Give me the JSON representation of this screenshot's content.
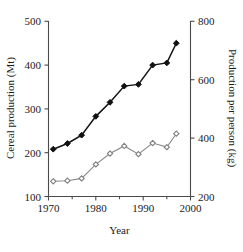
{
  "chart_data": {
    "type": "line",
    "title": "",
    "xlabel": "Year",
    "ylabel": "Cereal production (Mt)",
    "y2label": "Production per person (kg)",
    "xlim": [
      1970,
      2000
    ],
    "ylim": [
      100,
      500
    ],
    "y2lim": [
      200,
      800
    ],
    "xticks": [
      1970,
      1980,
      1990,
      2000
    ],
    "xtick_labels": [
      "1970",
      "1980",
      "1990",
      "2000"
    ],
    "xticks_minor": [
      1975,
      1985,
      1995
    ],
    "yticks": [
      100,
      200,
      300,
      400,
      500
    ],
    "ytick_labels": [
      "100",
      "200",
      "300",
      "400",
      "500"
    ],
    "y2ticks": [
      200,
      400,
      600,
      800
    ],
    "y2tick_labels": [
      "200",
      "400",
      "600",
      "800"
    ],
    "grid": false,
    "legend": "none",
    "series": [
      {
        "name": "Cereal production",
        "axis": "left",
        "marker": "filled-diamond",
        "color": "#111111",
        "x": [
          1971,
          1974,
          1977,
          1980,
          1983,
          1986,
          1989,
          1992,
          1995,
          1997
        ],
        "values": [
          208,
          221,
          240,
          283,
          315,
          352,
          356,
          400,
          405,
          450
        ]
      },
      {
        "name": "Production per person",
        "axis": "right",
        "marker": "open-diamond",
        "color": "#7d7d7d",
        "x": [
          1971,
          1974,
          1977,
          1980,
          1983,
          1986,
          1989,
          1992,
          1995,
          1997
        ],
        "values": [
          252,
          254,
          262,
          310,
          347,
          373,
          345,
          383,
          369,
          415
        ]
      }
    ]
  },
  "axes": {
    "left_title": "Cereal production (Mt)",
    "right_title": "Production per person (kg)",
    "bottom_title": "Year"
  }
}
